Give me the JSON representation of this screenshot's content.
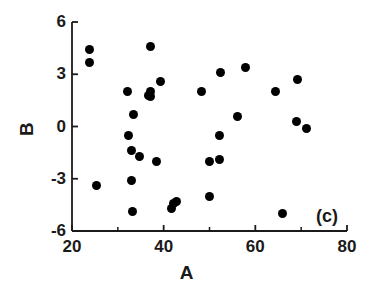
{
  "chart_data": {
    "type": "scatter",
    "title": "",
    "panel_label": "(c)",
    "xlabel": "A",
    "ylabel": "B",
    "xlim": [
      20,
      80
    ],
    "ylim": [
      -6,
      6
    ],
    "xticks": [
      20,
      40,
      60,
      80
    ],
    "xtick_labels": [
      "20",
      "40",
      "60",
      "80"
    ],
    "xminor_ticks": [
      30,
      50,
      70
    ],
    "yticks": [
      6,
      3,
      0,
      -3,
      -6
    ],
    "ytick_labels": [
      "6",
      "3",
      "0",
      "-3",
      "-6"
    ],
    "grid": false,
    "legend": null,
    "marker": "filled-circle",
    "marker_color": "#000000",
    "points": [
      {
        "A": 23.9,
        "B": 4.4
      },
      {
        "A": 23.9,
        "B": 3.7
      },
      {
        "A": 25.4,
        "B": -3.4
      },
      {
        "A": 32.2,
        "B": 2.0
      },
      {
        "A": 32.3,
        "B": -0.5
      },
      {
        "A": 33.4,
        "B": 0.7
      },
      {
        "A": 32.9,
        "B": -3.1
      },
      {
        "A": 32.9,
        "B": -1.4
      },
      {
        "A": 34.7,
        "B": -1.7
      },
      {
        "A": 33.1,
        "B": -4.9
      },
      {
        "A": 36.6,
        "B": 1.8
      },
      {
        "A": 37.2,
        "B": 1.7
      },
      {
        "A": 37.2,
        "B": 2.0
      },
      {
        "A": 37.1,
        "B": 4.6
      },
      {
        "A": 39.2,
        "B": 2.6
      },
      {
        "A": 38.4,
        "B": -2.0
      },
      {
        "A": 41.8,
        "B": -4.7
      },
      {
        "A": 42.2,
        "B": -4.4
      },
      {
        "A": 42.7,
        "B": -4.3
      },
      {
        "A": 48.3,
        "B": 2.0
      },
      {
        "A": 52.3,
        "B": 3.1
      },
      {
        "A": 49.9,
        "B": -2.0
      },
      {
        "A": 52.1,
        "B": -1.9
      },
      {
        "A": 50.1,
        "B": -4.0
      },
      {
        "A": 52.1,
        "B": -0.5
      },
      {
        "A": 56.2,
        "B": 0.6
      },
      {
        "A": 57.8,
        "B": 3.4
      },
      {
        "A": 64.3,
        "B": 2.0
      },
      {
        "A": 69.2,
        "B": 2.7
      },
      {
        "A": 69.0,
        "B": 0.3
      },
      {
        "A": 71.2,
        "B": -0.1
      },
      {
        "A": 65.9,
        "B": -5.0
      }
    ]
  },
  "axes": {
    "x_label": "A",
    "y_label": "B",
    "panel": "(c)"
  }
}
